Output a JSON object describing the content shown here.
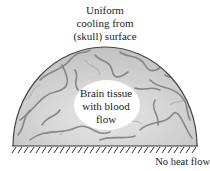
{
  "diagram": {
    "top_label": [
      "Uniform",
      "cooling from",
      "(skull) surface"
    ],
    "inner_label": [
      "Brain tissue",
      "with blood",
      "flow"
    ],
    "bottom_label": "No heat flow",
    "colors": {
      "tissue_base": "#cfcfcf",
      "tissue_vein": "#7a7a7a",
      "outline": "#444444",
      "inner_region": "#ffffff",
      "hatch": "#333333"
    }
  }
}
